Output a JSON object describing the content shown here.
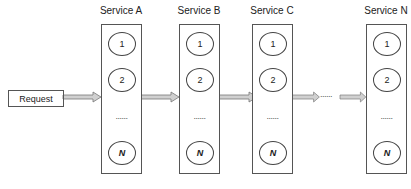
{
  "request": {
    "label": "Request"
  },
  "services": [
    {
      "label": "Service A",
      "nodes": [
        "1",
        "2"
      ],
      "ellipsis": "......",
      "last": "N"
    },
    {
      "label": "Service B",
      "nodes": [
        "1",
        "2"
      ],
      "ellipsis": "......",
      "last": "N"
    },
    {
      "label": "Service C",
      "nodes": [
        "1",
        "2"
      ],
      "ellipsis": "......",
      "last": "N"
    },
    {
      "label": "Service N",
      "nodes": [
        "1",
        "2"
      ],
      "ellipsis": "......",
      "last": "N"
    }
  ],
  "between": {
    "ellipsis": "......"
  },
  "colors": {
    "arrow_fill": "#d0d0d0",
    "arrow_stroke": "#777777",
    "border": "#555555"
  }
}
